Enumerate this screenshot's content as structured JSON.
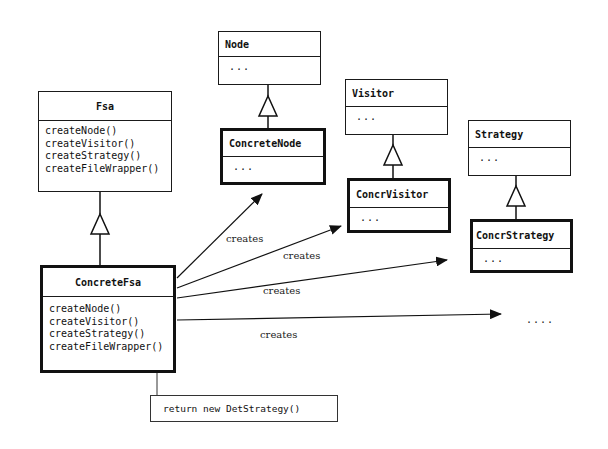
{
  "diagram": {
    "classes": {
      "fsa": {
        "name": "Fsa",
        "methods": [
          "createNode()",
          "createVisitor()",
          "createStrategy()",
          "createFileWrapper()"
        ]
      },
      "concrete_fsa": {
        "name": "ConcreteFsa",
        "methods": [
          "createNode()",
          "createVisitor()",
          "createStrategy()",
          "createFileWrapper()"
        ]
      },
      "node": {
        "name": "Node",
        "body": "..."
      },
      "concrete_node": {
        "name": "ConcreteNode",
        "body": "..."
      },
      "visitor": {
        "name": "Visitor",
        "body": "..."
      },
      "concr_visitor": {
        "name": "ConcrVisitor",
        "body": "..."
      },
      "strategy": {
        "name": "Strategy",
        "body": "..."
      },
      "concr_strategy": {
        "name": "ConcrStrategy",
        "body": "..."
      }
    },
    "relations": [
      {
        "from": "ConcreteFsa",
        "to": "ConcreteNode",
        "label": "creates"
      },
      {
        "from": "ConcreteFsa",
        "to": "ConcrVisitor",
        "label": "creates"
      },
      {
        "from": "ConcreteFsa",
        "to": "ConcrStrategy",
        "label": "creates"
      },
      {
        "from": "ConcreteFsa",
        "to": "...",
        "label": "creates"
      }
    ],
    "ellipsis": "....",
    "note": "return new DetStrategy()"
  }
}
